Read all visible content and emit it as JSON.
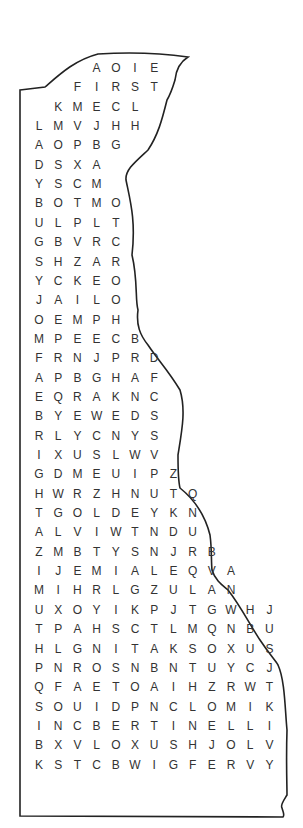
{
  "puzzle": {
    "type": "word-search",
    "shape": "state-outline",
    "colors": {
      "text": "#333333",
      "outline": "#222222",
      "background": "#ffffff"
    },
    "rows": [
      {
        "start": 3,
        "letters": "AOIE"
      },
      {
        "start": 2,
        "letters": "FIRST"
      },
      {
        "start": 1,
        "letters": "KMECL"
      },
      {
        "start": 0,
        "letters": "LMVJHH"
      },
      {
        "start": 0,
        "letters": "AOPBG"
      },
      {
        "start": 0,
        "letters": "DSXA"
      },
      {
        "start": 0,
        "letters": "YSCM"
      },
      {
        "start": 0,
        "letters": "BOTMO"
      },
      {
        "start": 0,
        "letters": "ULPLT"
      },
      {
        "start": 0,
        "letters": "GBVRC"
      },
      {
        "start": 0,
        "letters": "SHZAR"
      },
      {
        "start": 0,
        "letters": "YCKEO"
      },
      {
        "start": 0,
        "letters": "JAILO"
      },
      {
        "start": 0,
        "letters": "OEMPH"
      },
      {
        "start": 0,
        "letters": "MPEECB"
      },
      {
        "start": 0,
        "letters": "FRNJPRD"
      },
      {
        "start": 0,
        "letters": "APBGHAF"
      },
      {
        "start": 0,
        "letters": "EQRAKNC"
      },
      {
        "start": 0,
        "letters": "BYEWEDS"
      },
      {
        "start": 0,
        "letters": "RLYCNYS"
      },
      {
        "start": 0,
        "letters": "IXUSLWV"
      },
      {
        "start": 0,
        "letters": "GDMEUIPZ"
      },
      {
        "start": 0,
        "letters": "HWRZHNUTQ"
      },
      {
        "start": 0,
        "letters": "TGOLDEYKN"
      },
      {
        "start": 0,
        "letters": "ALVIWTNDU"
      },
      {
        "start": 0,
        "letters": "ZMBTYSNJRB"
      },
      {
        "start": 0,
        "letters": "IJEMIALEQVA"
      },
      {
        "start": 0,
        "letters": "MIHRLGZULAN"
      },
      {
        "start": 0,
        "letters": "UXOYIKPJTGWHJ"
      },
      {
        "start": 0,
        "letters": "TPAHSCTLMQNBU"
      },
      {
        "start": 0,
        "letters": "HLGNITAKSOXUS"
      },
      {
        "start": 0,
        "letters": "PNROSNBNTUYCJ"
      },
      {
        "start": 0,
        "letters": "QFAETOAIHZRWT"
      },
      {
        "start": 0,
        "letters": "SOUIDPNCLOMIK"
      },
      {
        "start": 0,
        "letters": "INCBERTINELLI"
      },
      {
        "start": 0,
        "letters": "BXVLOXUSHJOLV"
      },
      {
        "start": 0,
        "letters": "KSTCBWIGFERVY"
      }
    ]
  }
}
